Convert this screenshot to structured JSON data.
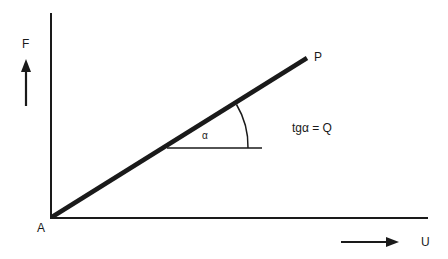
{
  "diagram": {
    "type": "force-displacement linear characteristic",
    "colors": {
      "ink": "#1a1a1a",
      "background": "#ffffff"
    },
    "labels": {
      "origin": "A",
      "y_axis": "F",
      "x_axis": "U",
      "line_end": "P",
      "angle": "α",
      "slope_formula": "tgα = Q"
    },
    "geometry": {
      "origin": [
        51,
        218
      ],
      "y_axis_top": [
        51,
        13
      ],
      "x_axis_end": [
        428,
        218
      ],
      "line_start": [
        52,
        218
      ],
      "line_end": [
        307,
        58
      ],
      "angle_vertex": [
        167,
        148
      ],
      "reference_line_end": [
        262,
        148
      ],
      "arc_radius": 81,
      "y_arrow": {
        "from": [
          26,
          106
        ],
        "to": [
          26,
          60
        ]
      },
      "x_arrow": {
        "from": [
          341,
          242
        ],
        "to": [
          398,
          242
        ]
      }
    }
  }
}
